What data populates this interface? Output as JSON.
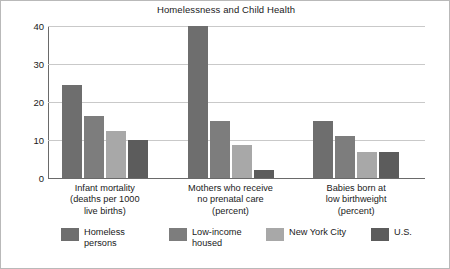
{
  "figure": {
    "border_color": "#b9b9b9",
    "background": "#ffffff"
  },
  "chart_data": {
    "type": "bar",
    "title": "Homelessness and Child Health",
    "xlabel": "",
    "ylabel": "",
    "ylim": [
      0,
      40
    ],
    "yticks": [
      0,
      10,
      20,
      30,
      40
    ],
    "ytick_labels": [
      "0",
      "10",
      "20",
      "30",
      "40"
    ],
    "grid": true,
    "grid_axis": "y",
    "legend_position": "bottom",
    "categories": [
      "Infant mortality\n(deaths per 1000\nlive births)",
      "Mothers who receive\nno prenatal care\n(percent)",
      "Babies born at\nlow birthweight\n(percent)"
    ],
    "series": [
      {
        "name": "Homeless\npersons",
        "legend_label": "Homeless persons",
        "color": "#6e6e6e",
        "values": [
          24.6,
          40.0,
          15.0
        ]
      },
      {
        "name": "Low-income\nhoused",
        "legend_label": "Low-income housed",
        "color": "#7d7d7d",
        "values": [
          16.2,
          15.0,
          11.1
        ]
      },
      {
        "name": "New York City",
        "legend_label": "New York City",
        "color": "#a8a8a8",
        "values": [
          12.3,
          8.7,
          6.8
        ]
      },
      {
        "name": "U.S.",
        "legend_label": "U.S.",
        "color": "#5c5c5c",
        "values": [
          10.0,
          2.0,
          6.8
        ]
      }
    ]
  }
}
